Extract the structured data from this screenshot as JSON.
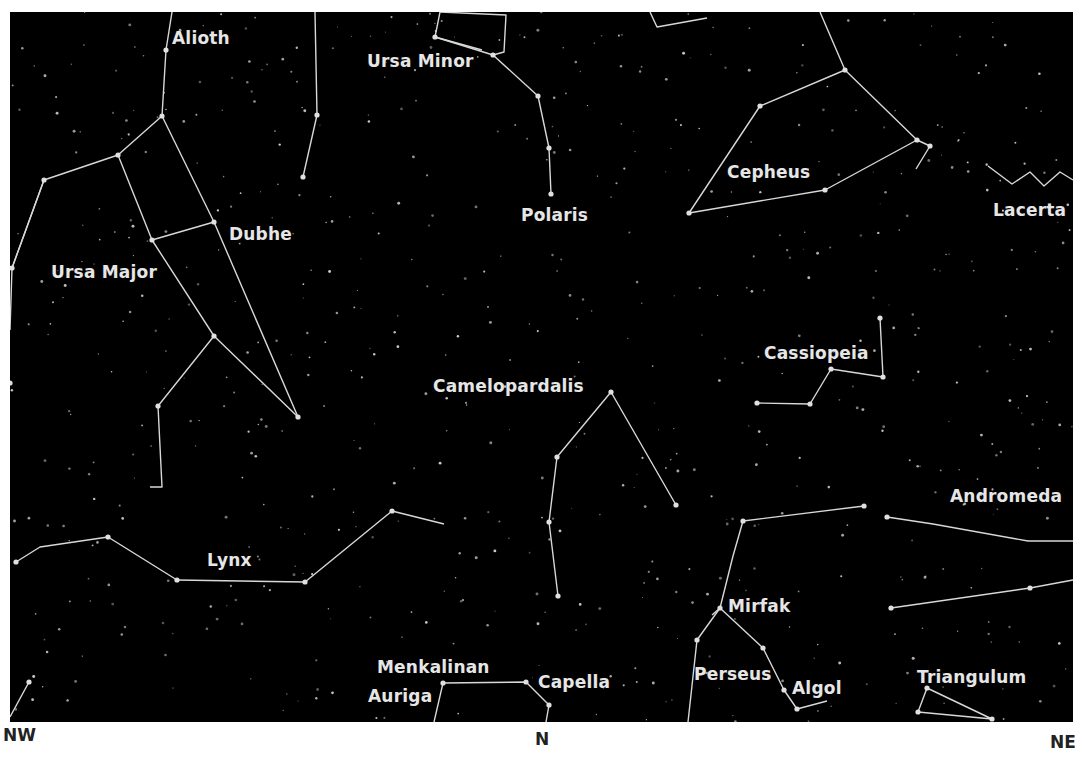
{
  "colors": {
    "sky": "#000000",
    "line": "#d8d8d8",
    "star": "#e0e0e0",
    "label": "#e6e6e6",
    "compass": "#222222"
  },
  "compass": {
    "left": "NW",
    "center": "N",
    "right": "NE"
  },
  "labels": {
    "alioth": "Alioth",
    "ursa_minor": "Ursa Minor",
    "cepheus": "Cepheus",
    "lacerta": "Lacerta",
    "polaris": "Polaris",
    "dubhe": "Dubhe",
    "ursa_major": "Ursa Major",
    "cassiopeia": "Cassiopeia",
    "camelopardalis": "Camelopardalis",
    "andromeda": "Andromeda",
    "lynx": "Lynx",
    "mirfak": "Mirfak",
    "menkalinan": "Menkalinan",
    "capella": "Capella",
    "auriga": "Auriga",
    "perseus": "Perseus",
    "algol": "Algol",
    "triangulum": "Triangulum"
  },
  "constellations": [
    {
      "name": "Ursa Major",
      "lines": [
        [
          [
            172,
            12
          ],
          [
            166,
            50
          ],
          [
            162,
            116
          ],
          [
            118,
            155
          ],
          [
            44,
            180
          ],
          [
            12,
            268
          ]
        ],
        [
          [
            118,
            155
          ],
          [
            152,
            240
          ],
          [
            214,
            222
          ],
          [
            298,
            417
          ]
        ],
        [
          [
            162,
            116
          ],
          [
            214,
            222
          ]
        ],
        [
          [
            152,
            240
          ],
          [
            214,
            336
          ],
          [
            298,
            417
          ]
        ],
        [
          [
            214,
            336
          ],
          [
            158,
            406
          ],
          [
            162,
            487
          ],
          [
            150,
            487
          ]
        ],
        [
          [
            44,
            180
          ],
          [
            12,
            268
          ],
          [
            10,
            330
          ]
        ]
      ]
    },
    {
      "name": "Ursa Minor",
      "lines": [
        [
          [
            440,
            12
          ],
          [
            435,
            37
          ],
          [
            493,
            55
          ],
          [
            538,
            96
          ],
          [
            549,
            148
          ],
          [
            551,
            194
          ]
        ],
        [
          [
            440,
            12
          ],
          [
            506,
            15
          ],
          [
            504,
            52
          ],
          [
            493,
            55
          ]
        ],
        [
          [
            435,
            37
          ],
          [
            482,
            50
          ]
        ]
      ]
    },
    {
      "name": "Draco",
      "lines": [
        [
          [
            315,
            12
          ],
          [
            317,
            115
          ],
          [
            303,
            177
          ]
        ]
      ]
    },
    {
      "name": "Cepheus",
      "lines": [
        [
          [
            820,
            12
          ],
          [
            845,
            70
          ],
          [
            760,
            106
          ],
          [
            689,
            213
          ],
          [
            825,
            190
          ],
          [
            917,
            140
          ],
          [
            845,
            70
          ]
        ],
        [
          [
            917,
            140
          ],
          [
            930,
            146
          ],
          [
            916,
            169
          ]
        ]
      ]
    },
    {
      "name": "Cepheus top",
      "lines": [
        [
          [
            650,
            12
          ],
          [
            657,
            27
          ],
          [
            707,
            18
          ]
        ]
      ]
    },
    {
      "name": "Lacerta",
      "lines": [
        [
          [
            988,
            166
          ],
          [
            1012,
            184
          ],
          [
            1030,
            172
          ],
          [
            1044,
            186
          ],
          [
            1060,
            172
          ],
          [
            1073,
            180
          ]
        ]
      ]
    },
    {
      "name": "Cassiopeia",
      "lines": [
        [
          [
            757,
            403
          ],
          [
            810,
            404
          ],
          [
            831,
            369
          ],
          [
            883,
            377
          ],
          [
            880,
            318
          ]
        ]
      ]
    },
    {
      "name": "Camelopardalis",
      "lines": [
        [
          [
            558,
            596
          ],
          [
            549,
            522
          ],
          [
            557,
            457
          ],
          [
            611,
            392
          ],
          [
            676,
            505
          ]
        ]
      ]
    },
    {
      "name": "Lynx",
      "lines": [
        [
          [
            16,
            562
          ],
          [
            40,
            547
          ],
          [
            108,
            537
          ],
          [
            177,
            580
          ],
          [
            305,
            582
          ],
          [
            392,
            511
          ],
          [
            444,
            524
          ]
        ]
      ]
    },
    {
      "name": "Andromeda",
      "lines": [
        [
          [
            887,
            517
          ],
          [
            933,
            524
          ],
          [
            1028,
            541
          ],
          [
            1073,
            541
          ]
        ],
        [
          [
            891,
            608
          ],
          [
            1030,
            588
          ],
          [
            1073,
            580
          ]
        ]
      ]
    },
    {
      "name": "Perseus",
      "lines": [
        [
          [
            864,
            506
          ],
          [
            743,
            521
          ],
          [
            733,
            556
          ],
          [
            720,
            608
          ],
          [
            697,
            640
          ],
          [
            688,
            722
          ]
        ],
        [
          [
            720,
            608
          ],
          [
            763,
            648
          ],
          [
            784,
            690
          ],
          [
            797,
            709
          ],
          [
            827,
            701
          ]
        ],
        [
          [
            720,
            608
          ],
          [
            712,
            615
          ]
        ]
      ]
    },
    {
      "name": "Triangulum",
      "lines": [
        [
          [
            927,
            688
          ],
          [
            918,
            712
          ],
          [
            992,
            719
          ],
          [
            927,
            688
          ]
        ]
      ]
    },
    {
      "name": "Auriga",
      "lines": [
        [
          [
            434,
            722
          ],
          [
            443,
            683
          ],
          [
            526,
            682
          ],
          [
            549,
            705
          ],
          [
            546,
            722
          ]
        ]
      ]
    },
    {
      "name": "NW corner",
      "lines": [
        [
          [
            10,
            717
          ],
          [
            29,
            682
          ]
        ]
      ]
    }
  ],
  "bright_stars": [
    [
      166,
      50
    ],
    [
      162,
      116
    ],
    [
      118,
      155
    ],
    [
      44,
      180
    ],
    [
      214,
      222
    ],
    [
      152,
      240
    ],
    [
      214,
      336
    ],
    [
      298,
      417
    ],
    [
      158,
      406
    ],
    [
      303,
      177
    ],
    [
      317,
      115
    ],
    [
      435,
      37
    ],
    [
      493,
      55
    ],
    [
      538,
      96
    ],
    [
      551,
      194
    ],
    [
      549,
      148
    ],
    [
      845,
      70
    ],
    [
      760,
      106
    ],
    [
      689,
      213
    ],
    [
      825,
      190
    ],
    [
      917,
      140
    ],
    [
      930,
      146
    ],
    [
      831,
      369
    ],
    [
      883,
      377
    ],
    [
      880,
      318
    ],
    [
      810,
      404
    ],
    [
      757,
      403
    ],
    [
      611,
      392
    ],
    [
      557,
      457
    ],
    [
      549,
      522
    ],
    [
      558,
      596
    ],
    [
      676,
      505
    ],
    [
      16,
      562
    ],
    [
      108,
      537
    ],
    [
      177,
      580
    ],
    [
      305,
      582
    ],
    [
      392,
      511
    ],
    [
      887,
      517
    ],
    [
      891,
      608
    ],
    [
      1030,
      588
    ],
    [
      743,
      521
    ],
    [
      864,
      506
    ],
    [
      720,
      608
    ],
    [
      697,
      640
    ],
    [
      763,
      648
    ],
    [
      784,
      690
    ],
    [
      797,
      709
    ],
    [
      927,
      688
    ],
    [
      992,
      719
    ],
    [
      918,
      712
    ],
    [
      443,
      683
    ],
    [
      526,
      682
    ],
    [
      549,
      705
    ],
    [
      29,
      682
    ],
    [
      12,
      268
    ],
    [
      10,
      383
    ]
  ]
}
